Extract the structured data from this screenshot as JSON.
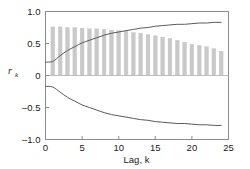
{
  "chart_data": {
    "type": "bar",
    "title": "",
    "subtitle": "",
    "xlabel": "Lag, k",
    "ylabel": "r_k",
    "ylabel_main": "r",
    "ylabel_sub": "k",
    "xlim": [
      0,
      25
    ],
    "ylim": [
      -1.0,
      1.0
    ],
    "grid": false,
    "legend": "none",
    "xticks": [
      0,
      5,
      10,
      15,
      20,
      25
    ],
    "xtick_labels": [
      "0",
      "5",
      "10",
      "15",
      "20",
      "25"
    ],
    "yticks": [
      1.0,
      0.5,
      0,
      -0.5,
      -1.0
    ],
    "ytick_labels": [
      "1.0",
      "0.5",
      "0",
      "–0.5",
      "–1.0"
    ],
    "zero_line": 0,
    "bar_color": "#c9c9c9",
    "bar_edge_color": "#c9c9c9",
    "curve_color": "#5a5a5a",
    "frame_color": "#8c8c8c",
    "text_color": "#1a1a1a",
    "series": [
      {
        "name": "Sample autocorrelation r_k",
        "type": "bar",
        "categories": [
          1,
          2,
          3,
          4,
          5,
          6,
          7,
          8,
          9,
          10,
          11,
          12,
          13,
          14,
          15,
          16,
          17,
          18,
          19,
          20,
          21,
          22,
          23,
          24
        ],
        "values": [
          0.76,
          0.76,
          0.75,
          0.75,
          0.74,
          0.73,
          0.73,
          0.72,
          0.71,
          0.7,
          0.69,
          0.67,
          0.66,
          0.64,
          0.62,
          0.6,
          0.58,
          0.55,
          0.52,
          0.49,
          0.47,
          0.45,
          0.42,
          0.38
        ]
      },
      {
        "name": "Upper confidence curve",
        "type": "line",
        "x": [
          0,
          1,
          2,
          3,
          4,
          5,
          6,
          7,
          8,
          9,
          10,
          11,
          12,
          13,
          14,
          15,
          16,
          17,
          18,
          19,
          20,
          21,
          22,
          23,
          24
        ],
        "values": [
          0.21,
          0.22,
          0.31,
          0.39,
          0.45,
          0.51,
          0.55,
          0.59,
          0.63,
          0.66,
          0.68,
          0.7,
          0.72,
          0.74,
          0.75,
          0.77,
          0.78,
          0.79,
          0.8,
          0.8,
          0.81,
          0.82,
          0.82,
          0.83,
          0.83
        ]
      },
      {
        "name": "Lower confidence curve",
        "type": "line",
        "x": [
          0,
          1,
          2,
          3,
          4,
          5,
          6,
          7,
          8,
          9,
          10,
          11,
          12,
          13,
          14,
          15,
          16,
          17,
          18,
          19,
          20,
          21,
          22,
          23,
          24
        ],
        "values": [
          -0.17,
          -0.18,
          -0.26,
          -0.34,
          -0.4,
          -0.46,
          -0.5,
          -0.54,
          -0.58,
          -0.61,
          -0.63,
          -0.65,
          -0.67,
          -0.69,
          -0.7,
          -0.72,
          -0.73,
          -0.74,
          -0.75,
          -0.75,
          -0.76,
          -0.77,
          -0.77,
          -0.78,
          -0.78
        ]
      }
    ]
  }
}
